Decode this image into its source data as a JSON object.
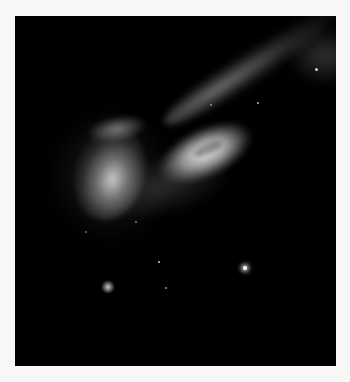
{
  "image": {
    "subject": "interacting galaxy pair with long tidal tail",
    "background_color": "#000000",
    "page_color": "#f7f7f7"
  }
}
